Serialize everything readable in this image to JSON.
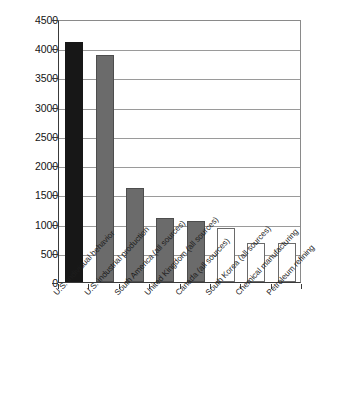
{
  "chart_data": {
    "type": "bar",
    "title": "",
    "subtitle": "",
    "xlabel": "",
    "ylabel": "",
    "ylim": [
      0,
      4500
    ],
    "ytick_step": 500,
    "yticks": [
      0,
      500,
      1000,
      1500,
      2000,
      2500,
      3000,
      3500,
      4000,
      4500
    ],
    "grid": true,
    "legend": "none",
    "categories": [
      "U.S. individual behavior",
      "U.S. industrial production",
      "South America (all sources)",
      "United Kingdom (all sources)",
      "Canada (all sources)",
      "South Korea (all sources)",
      "Chemical manufacturing",
      "Petroleum refining"
    ],
    "values": [
      4100,
      3880,
      1600,
      1100,
      1040,
      920,
      660,
      660
    ],
    "bar_colors": [
      "#171717",
      "#6b6b6b",
      "#6b6b6b",
      "#6b6b6b",
      "#6b6b6b",
      "#ffffff",
      "#ffffff",
      "#ffffff"
    ],
    "bar_styles": [
      "black",
      "gray",
      "gray",
      "gray",
      "gray",
      "white",
      "white",
      "white"
    ]
  },
  "colors": {
    "black_bar": "#171717",
    "gray_bar": "#6b6b6b",
    "white_bar": "#ffffff",
    "axis": "#3a3a3a",
    "grid": "#9a9a9a",
    "background": "#ffffff"
  }
}
